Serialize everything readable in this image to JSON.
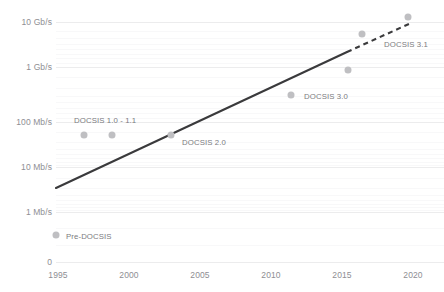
{
  "chart_data": {
    "type": "scatter",
    "title": "",
    "subtitle": "",
    "xlabel": "",
    "ylabel": "",
    "yscale": "log",
    "grid": true,
    "legend_position": "none",
    "xlim": [
      1994,
      2020.5
    ],
    "ylim_labels": [
      "0",
      "1 Mb/s",
      "10 Mb/s",
      "100 Mb/s",
      "1 Gb/s",
      "10 Gb/s"
    ],
    "y_tick_labels": [
      "10 Gb/s",
      "1 Gb/s",
      "100 Mb/s",
      "10 Mb/s",
      "1 Mb/s",
      "0"
    ],
    "y_tick_values": [
      10000,
      1000,
      100,
      10,
      1,
      0
    ],
    "x_tick_labels": [
      "1995",
      "2000",
      "2005",
      "2010",
      "2015",
      "2020"
    ],
    "x_tick_values": [
      1995,
      2000,
      2005,
      2010,
      2015,
      2020
    ],
    "points": [
      {
        "label": "Pre-DOCSIS",
        "x": 1995,
        "y_mbps": 0.5,
        "label_anchor": "right"
      },
      {
        "label": "DOCSIS 1.0 - 1.1",
        "x": 1997,
        "y_mbps": 38,
        "label_anchor": "above"
      },
      {
        "label": "",
        "x": 1999,
        "y_mbps": 38,
        "label_anchor": "none"
      },
      {
        "label": "DOCSIS 2.0",
        "x": 2003,
        "y_mbps": 38,
        "label_anchor": "right"
      },
      {
        "label": "DOCSIS 3.0",
        "x": 2011,
        "y_mbps": 160,
        "label_anchor": "right"
      },
      {
        "label": "",
        "x": 2015,
        "y_mbps": 900,
        "label_anchor": "none"
      },
      {
        "label": "",
        "x": 2016,
        "y_mbps": 5000,
        "label_anchor": "none"
      },
      {
        "label": "DOCSIS 3.1",
        "x": 2019.5,
        "y_mbps": 10000,
        "label_anchor": "below-left"
      }
    ],
    "trend_line": {
      "style_solid": "solid",
      "style_extrapolated": "dashed",
      "solid_start": {
        "x": 1995,
        "y_mbps": 4.2
      },
      "solid_end": {
        "x": 2015.5,
        "y_mbps": 1700
      },
      "dashed_end": {
        "x": 2019.9,
        "y_mbps": 7800
      },
      "color": "#3a3a3c"
    },
    "annotations": [
      "DOCSIS 1.0 - 1.1",
      "DOCSIS 2.0",
      "DOCSIS 3.0",
      "DOCSIS 3.1",
      "Pre-DOCSIS"
    ],
    "colors": {
      "dot": "#bfbfc2",
      "trend": "#3a3a3c",
      "gridline": "#f2f2f4",
      "tick_text": "#8e8e93",
      "label_text": "#7b7b80",
      "background": "#ffffff"
    }
  },
  "y_ticks": [
    {
      "label": "10 Gb/s",
      "top": 22
    },
    {
      "label": "1 Gb/s",
      "top": 67
    },
    {
      "label": "100 Mb/s",
      "top": 122
    },
    {
      "label": "10 Mb/s",
      "top": 167
    },
    {
      "label": "1 Mb/s",
      "top": 212
    },
    {
      "label": "0",
      "top": 262
    }
  ],
  "x_ticks": [
    {
      "label": "1995",
      "left": 58
    },
    {
      "label": "2000",
      "left": 129
    },
    {
      "label": "2005",
      "left": 200
    },
    {
      "label": "2010",
      "left": 271
    },
    {
      "label": "2015",
      "left": 342
    },
    {
      "label": "2020",
      "left": 413
    }
  ],
  "dots": [
    {
      "name": "point-pre-docsis",
      "left": 56,
      "top": 235
    },
    {
      "name": "point-docsis-1-0",
      "left": 84,
      "top": 135
    },
    {
      "name": "point-docsis-1-1",
      "left": 112,
      "top": 135
    },
    {
      "name": "point-docsis-2-0",
      "left": 171,
      "top": 135
    },
    {
      "name": "point-docsis-3-0",
      "left": 291,
      "top": 95
    },
    {
      "name": "point-docsis-3-1-low",
      "left": 348,
      "top": 70
    },
    {
      "name": "point-docsis-3-1-mid",
      "left": 362,
      "top": 34
    },
    {
      "name": "point-docsis-3-1-high",
      "left": 408,
      "top": 17
    }
  ],
  "point_labels": [
    {
      "name": "label-pre-docsis",
      "text": "Pre-DOCSIS",
      "left": 66,
      "top": 236
    },
    {
      "name": "label-docsis-1",
      "text": "DOCSIS 1.0 - 1.1",
      "left": 74,
      "top": 120
    },
    {
      "name": "label-docsis-2",
      "text": "DOCSIS 2.0",
      "left": 182,
      "top": 142
    },
    {
      "name": "label-docsis-3",
      "text": "DOCSIS 3.0",
      "left": 304,
      "top": 96
    },
    {
      "name": "label-docsis-31",
      "text": "DOCSIS 3.1",
      "left": 384,
      "top": 44
    }
  ],
  "gridlines": [
    {
      "top": 22,
      "kind": "major"
    },
    {
      "top": 31,
      "kind": "minor"
    },
    {
      "top": 38,
      "kind": "minor"
    },
    {
      "top": 44,
      "kind": "minor"
    },
    {
      "top": 49,
      "kind": "minor"
    },
    {
      "top": 54,
      "kind": "minor"
    },
    {
      "top": 58,
      "kind": "minor"
    },
    {
      "top": 63,
      "kind": "minor"
    },
    {
      "top": 67,
      "kind": "major"
    },
    {
      "top": 77,
      "kind": "minor"
    },
    {
      "top": 88,
      "kind": "minor"
    },
    {
      "top": 96,
      "kind": "minor"
    },
    {
      "top": 102,
      "kind": "minor"
    },
    {
      "top": 108,
      "kind": "minor"
    },
    {
      "top": 113,
      "kind": "minor"
    },
    {
      "top": 118,
      "kind": "minor"
    },
    {
      "top": 122,
      "kind": "major"
    },
    {
      "top": 132,
      "kind": "minor"
    },
    {
      "top": 142,
      "kind": "minor"
    },
    {
      "top": 149,
      "kind": "minor"
    },
    {
      "top": 154,
      "kind": "minor"
    },
    {
      "top": 158,
      "kind": "minor"
    },
    {
      "top": 162,
      "kind": "minor"
    },
    {
      "top": 165,
      "kind": "minor"
    },
    {
      "top": 167,
      "kind": "major"
    },
    {
      "top": 178,
      "kind": "minor"
    },
    {
      "top": 188,
      "kind": "minor"
    },
    {
      "top": 195,
      "kind": "minor"
    },
    {
      "top": 200,
      "kind": "minor"
    },
    {
      "top": 204,
      "kind": "minor"
    },
    {
      "top": 207,
      "kind": "minor"
    },
    {
      "top": 210,
      "kind": "minor"
    },
    {
      "top": 212,
      "kind": "major"
    },
    {
      "top": 228,
      "kind": "minor"
    },
    {
      "top": 245,
      "kind": "minor"
    },
    {
      "top": 262,
      "kind": "major"
    }
  ]
}
